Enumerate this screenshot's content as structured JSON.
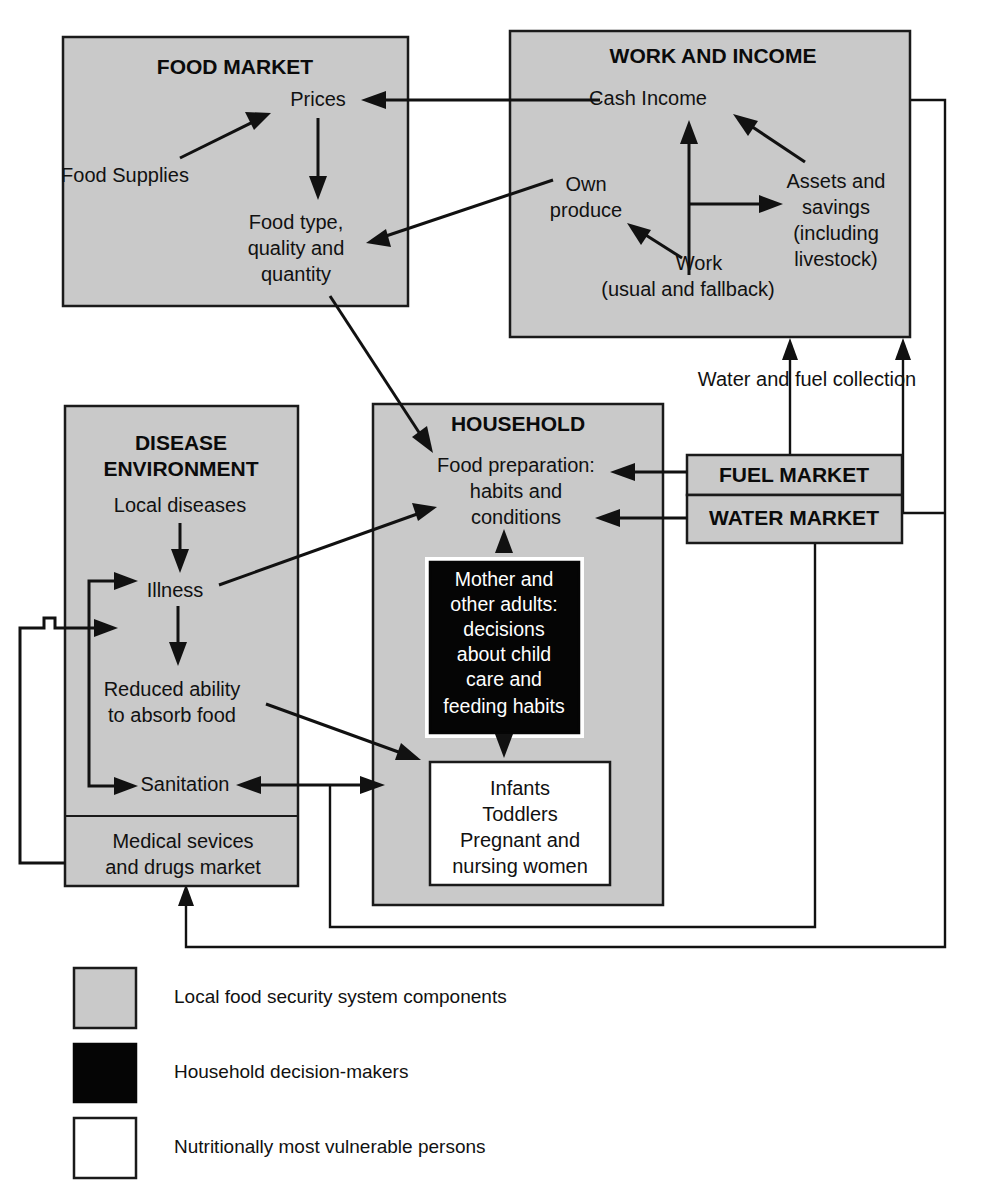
{
  "diagram": {
    "title": "Local food security system",
    "colors": {
      "component_fill": "#c9c9c9",
      "decision_fill": "#050505",
      "vulnerable_fill": "#ffffff",
      "line": "#111111"
    },
    "boxes": {
      "food_market": {
        "title": "FOOD MARKET",
        "nodes": {
          "prices": "Prices",
          "food_supplies": "Food Supplies",
          "food_type_l1": "Food type,",
          "food_type_l2": "quality and",
          "food_type_l3": "quantity"
        }
      },
      "work_income": {
        "title": "WORK AND INCOME",
        "nodes": {
          "cash_income": "Cash Income",
          "own_produce_l1": "Own",
          "own_produce_l2": "produce",
          "work_l1": "Work",
          "work_l2": "(usual and fallback)",
          "assets_l1": "Assets and",
          "assets_l2": "savings",
          "assets_l3": "(including",
          "assets_l4": "livestock)"
        }
      },
      "disease_environment": {
        "title_l1": "DISEASE",
        "title_l2": "ENVIRONMENT",
        "nodes": {
          "local_diseases": "Local diseases",
          "illness": "Illness",
          "reduced_l1": "Reduced ability",
          "reduced_l2": "to absorb food",
          "sanitation": "Sanitation",
          "medical_l1": "Medical sevices",
          "medical_l2": "and drugs market"
        }
      },
      "household": {
        "title": "HOUSEHOLD",
        "nodes": {
          "food_prep_l1": "Food preparation:",
          "food_prep_l2": "habits and",
          "food_prep_l3": "conditions",
          "mother_l1": "Mother and",
          "mother_l2": "other adults:",
          "mother_l3": "decisions",
          "mother_l4": "about child",
          "mother_l5": "care and",
          "mother_l6": "feeding habits",
          "vulnerable_l1": "Infants",
          "vulnerable_l2": "Toddlers",
          "vulnerable_l3": "Pregnant and",
          "vulnerable_l4": "nursing women"
        }
      },
      "fuel_market": {
        "title": "FUEL MARKET"
      },
      "water_market": {
        "title": "WATER MARKET"
      }
    },
    "free_labels": {
      "water_fuel_collection": "Water and fuel collection"
    },
    "legend": {
      "items": [
        {
          "swatch": "component_fill",
          "label": "Local food security system components"
        },
        {
          "swatch": "decision_fill",
          "label": "Household decision-makers"
        },
        {
          "swatch": "vulnerable_fill",
          "label": "Nutritionally most vulnerable persons"
        }
      ]
    }
  }
}
